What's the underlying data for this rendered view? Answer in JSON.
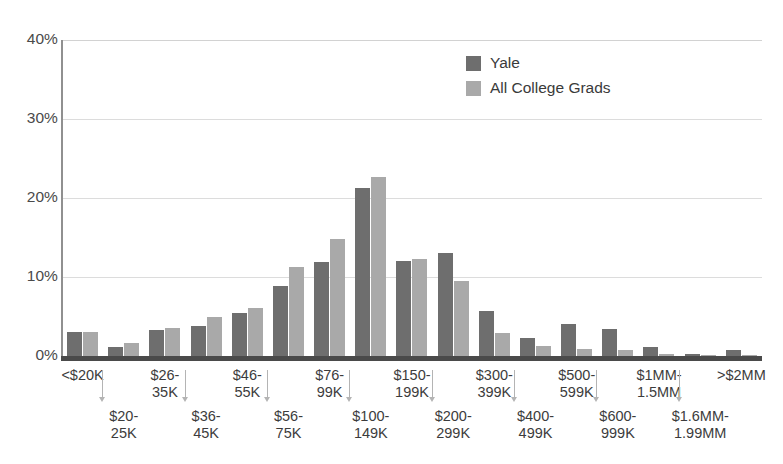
{
  "chart_data": {
    "type": "bar",
    "title": "",
    "subtitle": "",
    "xlabel": "",
    "ylabel": "",
    "ylim": [
      0,
      40
    ],
    "yticks": [
      "0%",
      "10%",
      "20%",
      "30%",
      "40%"
    ],
    "ytick_values": [
      0,
      10,
      20,
      30,
      40
    ],
    "grid": true,
    "legend_position": "top-center-right",
    "categories": [
      "<$20K",
      "$20-25K",
      "$26-35K",
      "$36-45K",
      "$46-55K",
      "$56-75K",
      "$76-99K",
      "$100-149K",
      "$150-199K",
      "$200-299K",
      "$300-399K",
      "$400-499K",
      "$500-599K",
      "$600-999K",
      "$1MM-1.5MM",
      "$1.6MM-1.99MM",
      ">$2MM"
    ],
    "series": [
      {
        "name": "Yale",
        "color": "#6e6e6e",
        "values": [
          3.0,
          1.1,
          3.3,
          3.8,
          5.5,
          8.8,
          11.9,
          21.3,
          12.0,
          13.1,
          5.7,
          2.3,
          4.1,
          3.4,
          1.2,
          0.2,
          0.7
        ]
      },
      {
        "name": "All College Grads",
        "color": "#a9a9a9",
        "values": [
          3.0,
          1.7,
          3.5,
          4.9,
          6.1,
          11.3,
          14.8,
          22.7,
          12.3,
          9.5,
          2.9,
          1.3,
          0.9,
          0.8,
          0.3,
          0.1,
          0.1
        ]
      }
    ]
  },
  "legend": {
    "items": [
      {
        "label": "Yale",
        "color": "#6e6e6e"
      },
      {
        "label": "All College Grads",
        "color": "#a9a9a9"
      }
    ]
  },
  "colors": {
    "yale": "#6e6e6e",
    "all_college_grads": "#a9a9a9",
    "gridline": "#dcdcdc",
    "axis": "#4a4a4a",
    "text": "#3c3c3c"
  }
}
